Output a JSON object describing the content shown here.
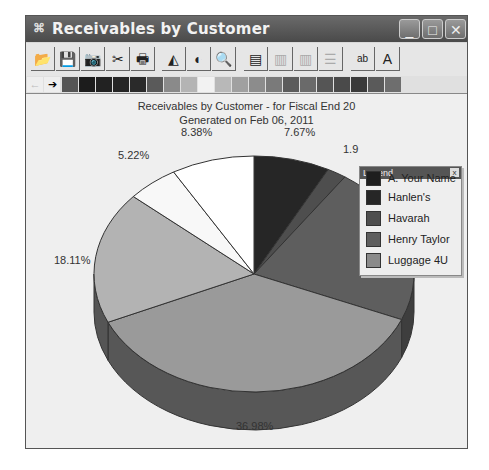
{
  "window": {
    "title": "Receivables by Customer",
    "controls": {
      "minimize": "_",
      "maximize": "□",
      "close": "✕"
    }
  },
  "toolbar": {
    "buttons": [
      {
        "name": "open-icon",
        "glyph": "📂"
      },
      {
        "name": "save-icon",
        "glyph": "💾"
      },
      {
        "name": "camera-icon",
        "glyph": "📷"
      },
      {
        "name": "cut-icon",
        "glyph": "✂"
      },
      {
        "name": "print-icon",
        "glyph": "🖶"
      },
      {
        "name": "3d-view-icon",
        "glyph": "◭"
      },
      {
        "name": "rotate-icon",
        "glyph": "◐"
      },
      {
        "name": "print-preview-icon",
        "glyph": "🔍"
      },
      {
        "name": "data-grid-icon",
        "glyph": "▤"
      },
      {
        "name": "data-editor-icon",
        "glyph": "▥"
      },
      {
        "name": "vertical-grid-icon",
        "glyph": "▥"
      },
      {
        "name": "horizontal-grid-icon",
        "glyph": "☰"
      },
      {
        "name": "point-labels-icon",
        "glyph": "ab"
      },
      {
        "name": "font-icon",
        "glyph": "A"
      }
    ]
  },
  "palette": {
    "colors": [
      "#555555",
      "#1c1c1c",
      "#222222",
      "#252525",
      "#2a2a2a",
      "#5a5a5a",
      "#8a8a8a",
      "#b4b4b4",
      "#f2f2f2",
      "#b8b8b8",
      "#a0a0a0",
      "#8c8c8c",
      "#7a7a7a",
      "#5c5c5c",
      "#6a6a6a",
      "#555555",
      "#4a4a4a",
      "#3a3a3a",
      "#5a5a5a",
      "#6e6e6e"
    ]
  },
  "chart_data": {
    "type": "pie",
    "title": "Receivables by Customer - for Fiscal End 20",
    "subtitle": "Generated on Feb 06, 2011",
    "labels_visible": [
      "7.67%",
      "1.9",
      "21.69%",
      "36.98%",
      "18.11%",
      "5.22%",
      "8.38%"
    ],
    "slices": [
      {
        "name": "Hanlen's",
        "value": 7.67,
        "label": "7.67%",
        "color": "#262626",
        "side": "#151515"
      },
      {
        "name": "Havarah",
        "value": 1.95,
        "label": "1.9",
        "color": "#4e4e4e",
        "side": "#333333"
      },
      {
        "name": "Henry Taylor",
        "value": 21.69,
        "label": "21.69%",
        "color": "#5e5e5e",
        "side": "#3e3e3e"
      },
      {
        "name": "Luggage 4U",
        "value": 36.98,
        "label": "36.98%",
        "color": "#9a9a9a",
        "side": "#575757"
      },
      {
        "name": "",
        "value": 18.11,
        "label": "18.11%",
        "color": "#b3b3b3",
        "side": "#555555"
      },
      {
        "name": "",
        "value": 5.22,
        "label": "5.22%",
        "color": "#f8f8f8",
        "side": "#777777"
      },
      {
        "name": "",
        "value": 8.38,
        "label": "8.38%",
        "color": "#ffffff",
        "side": "#888888"
      }
    ],
    "legend_position": "top-right floating"
  },
  "legend": {
    "title": "Legend",
    "close": "x",
    "items": [
      {
        "label": "A. Your Name",
        "color": "#1e1e1e"
      },
      {
        "label": "Hanlen's",
        "color": "#262626"
      },
      {
        "label": "Havarah",
        "color": "#4e4e4e"
      },
      {
        "label": "Henry Taylor",
        "color": "#5e5e5e"
      },
      {
        "label": "Luggage 4U",
        "color": "#8a8a8a"
      }
    ]
  }
}
